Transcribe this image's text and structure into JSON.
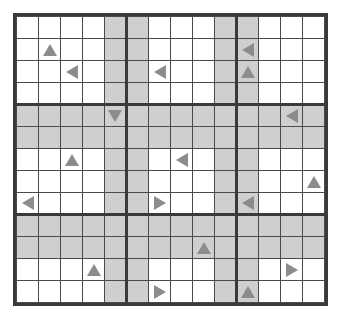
{
  "puzzle": {
    "type": "grid-arrow-puzzle",
    "columns": 14,
    "rows": 13,
    "cell_size_px": 22,
    "colors": {
      "background": "#ffffff",
      "cell_fill": "#ffffff",
      "shaded_fill": "#cfcfcf",
      "grid_line": "#4a4a4a",
      "block_line": "#3a3a3a",
      "arrow_fill": "#8c8c8c"
    },
    "shaded_columns": [
      4,
      5,
      9,
      10
    ],
    "shaded_rows": [
      4,
      5,
      9,
      10
    ],
    "block_column_breaks": [
      5,
      10
    ],
    "block_row_breaks": [
      4,
      9
    ],
    "arrows": [
      {
        "row": 1,
        "col": 1,
        "dir": "up"
      },
      {
        "row": 1,
        "col": 10,
        "dir": "left"
      },
      {
        "row": 2,
        "col": 2,
        "dir": "left"
      },
      {
        "row": 2,
        "col": 6,
        "dir": "left"
      },
      {
        "row": 2,
        "col": 10,
        "dir": "up"
      },
      {
        "row": 4,
        "col": 4,
        "dir": "down"
      },
      {
        "row": 4,
        "col": 12,
        "dir": "left"
      },
      {
        "row": 6,
        "col": 2,
        "dir": "up"
      },
      {
        "row": 6,
        "col": 7,
        "dir": "left"
      },
      {
        "row": 7,
        "col": 13,
        "dir": "up"
      },
      {
        "row": 8,
        "col": 0,
        "dir": "left"
      },
      {
        "row": 8,
        "col": 6,
        "dir": "right"
      },
      {
        "row": 8,
        "col": 10,
        "dir": "left"
      },
      {
        "row": 10,
        "col": 8,
        "dir": "up"
      },
      {
        "row": 11,
        "col": 3,
        "dir": "up"
      },
      {
        "row": 11,
        "col": 12,
        "dir": "right"
      },
      {
        "row": 12,
        "col": 6,
        "dir": "right"
      },
      {
        "row": 12,
        "col": 10,
        "dir": "up"
      },
      {
        "row": 13,
        "col": 1,
        "dir": "right"
      }
    ]
  }
}
